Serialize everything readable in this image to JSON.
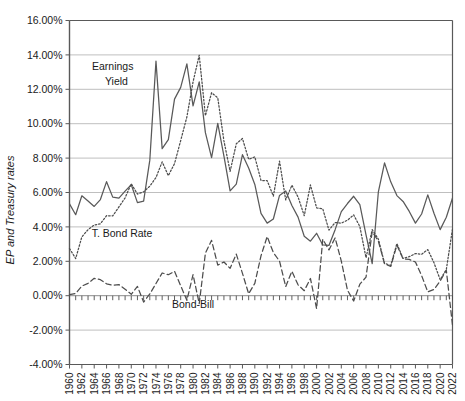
{
  "chart_data": {
    "type": "line",
    "title": "",
    "xlabel": "",
    "ylabel": "EP and Treasury rates",
    "ylim": [
      -4,
      16
    ],
    "ytick_step": 2,
    "ytick_labels": [
      "16.00%",
      "14.00%",
      "12.00%",
      "10.00%",
      "8.00%",
      "6.00%",
      "4.00%",
      "2.00%",
      "0.00%",
      "-2.00%",
      "-4.00%"
    ],
    "xlim": [
      1960,
      2022
    ],
    "xtick_labels": [
      "1960",
      "1962",
      "1964",
      "1966",
      "1968",
      "1970",
      "1972",
      "1974",
      "1976",
      "1978",
      "1980",
      "1982",
      "1984",
      "1986",
      "1988",
      "1990",
      "1992",
      "1994",
      "1996",
      "1998",
      "2000",
      "2002",
      "2004",
      "2006",
      "2008",
      "2010",
      "2012",
      "2014",
      "2016",
      "2018",
      "2020",
      "2022"
    ],
    "xtick_step": 2,
    "minor_tick_step": 1,
    "grid": "horizontal",
    "legend_position": "inline-annotations",
    "x": [
      1960,
      1961,
      1962,
      1963,
      1964,
      1965,
      1966,
      1967,
      1968,
      1969,
      1970,
      1971,
      1972,
      1973,
      1974,
      1975,
      1976,
      1977,
      1978,
      1979,
      1980,
      1981,
      1982,
      1983,
      1984,
      1985,
      1986,
      1987,
      1988,
      1989,
      1990,
      1991,
      1992,
      1993,
      1994,
      1995,
      1996,
      1997,
      1998,
      1999,
      2000,
      2001,
      2002,
      2003,
      2004,
      2005,
      2006,
      2007,
      2008,
      2009,
      2010,
      2011,
      2012,
      2013,
      2014,
      2015,
      2016,
      2017,
      2018,
      2019,
      2020,
      2021,
      2022
    ],
    "series": [
      {
        "name": "Earnings Yield",
        "style": "solid",
        "color": "#595959",
        "values": [
          5.34,
          4.71,
          5.81,
          5.51,
          5.19,
          5.59,
          6.63,
          5.73,
          5.67,
          6.08,
          6.45,
          5.41,
          5.5,
          7.88,
          13.64,
          8.55,
          9.07,
          11.43,
          12.11,
          13.48,
          11.04,
          12.43,
          9.48,
          8.03,
          10.02,
          8.12,
          6.09,
          6.49,
          8.2,
          7.42,
          6.47,
          4.79,
          4.22,
          4.46,
          5.83,
          6.09,
          5.24,
          4.57,
          3.46,
          3.17,
          3.63,
          2.95,
          2.92,
          3.84,
          4.89,
          5.36,
          5.78,
          5.29,
          3.54,
          1.86,
          6.04,
          7.72,
          6.62,
          5.82,
          5.48,
          4.9,
          4.22,
          4.75,
          5.86,
          4.79,
          3.84,
          4.56,
          5.68
        ],
        "annotation": "Earnings\nYield"
      },
      {
        "name": "T. Bond Rate",
        "style": "dotted",
        "color": "#4d4d4d",
        "values": [
          2.74,
          2.16,
          3.42,
          3.84,
          4.11,
          4.18,
          4.65,
          4.64,
          5.16,
          5.69,
          6.51,
          5.91,
          6.04,
          6.37,
          6.87,
          7.78,
          6.98,
          7.68,
          9.02,
          10.39,
          12.43,
          13.98,
          10.47,
          11.8,
          11.51,
          9.0,
          7.23,
          8.83,
          9.14,
          7.93,
          8.07,
          6.7,
          6.69,
          5.79,
          7.82,
          5.57,
          6.42,
          5.74,
          4.65,
          6.44,
          5.11,
          5.05,
          3.81,
          4.25,
          4.22,
          4.39,
          4.7,
          4.02,
          2.21,
          3.84,
          3.29,
          1.88,
          1.76,
          3.03,
          2.17,
          2.27,
          2.45,
          2.41,
          2.68,
          1.92,
          0.93,
          1.52,
          3.88
        ],
        "annotation": "T. Bond Rate"
      },
      {
        "name": "Bond-Bill",
        "style": "dashed",
        "color": "#4d4d4d",
        "values": [
          0.06,
          0.13,
          0.56,
          0.72,
          1.01,
          0.93,
          0.69,
          0.61,
          0.65,
          0.38,
          0.08,
          0.54,
          -0.37,
          0.1,
          0.71,
          1.32,
          1.22,
          1.42,
          0.58,
          -0.27,
          1.22,
          -0.46,
          2.47,
          3.22,
          1.78,
          1.96,
          1.59,
          2.42,
          1.3,
          0.11,
          0.72,
          2.32,
          3.44,
          2.51,
          2.01,
          0.53,
          1.42,
          0.63,
          0.29,
          1.0,
          -0.75,
          3.28,
          2.66,
          3.36,
          2.01,
          0.32,
          -0.31,
          0.67,
          1.08,
          3.72,
          3.17,
          1.85,
          1.7,
          2.94,
          2.14,
          2.11,
          1.96,
          1.17,
          0.22,
          0.36,
          0.85,
          1.48,
          -1.72
        ],
        "annotation": "Bond-Bill"
      }
    ],
    "annotations": [
      {
        "text": "Earnings",
        "x": 1967.0,
        "y": 13.15
      },
      {
        "text": "Yield",
        "x": 1967.6,
        "y": 12.25
      },
      {
        "text": "T. Bond Rate",
        "x": 1968.5,
        "y": 3.4
      },
      {
        "text": "Bond-Bill",
        "x": 1980.0,
        "y": -0.72
      }
    ],
    "colors": {
      "axis": "#595959",
      "grid": "#bfbfbf",
      "text": "#1a1a1a",
      "background": "#ffffff"
    }
  }
}
